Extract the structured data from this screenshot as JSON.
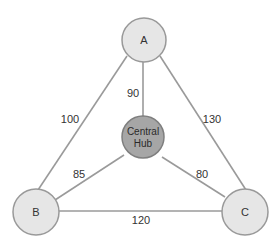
{
  "diagram": {
    "type": "network-graph",
    "nodes": [
      {
        "id": "A",
        "label": "A"
      },
      {
        "id": "B",
        "label": "B"
      },
      {
        "id": "C",
        "label": "C"
      },
      {
        "id": "hub",
        "label_line1": "Central",
        "label_line2": "Hub"
      }
    ],
    "edges": [
      {
        "from": "A",
        "to": "B",
        "weight": "100"
      },
      {
        "from": "A",
        "to": "C",
        "weight": "130"
      },
      {
        "from": "B",
        "to": "C",
        "weight": "120"
      },
      {
        "from": "A",
        "to": "hub",
        "weight": "90"
      },
      {
        "from": "B",
        "to": "hub",
        "weight": "85"
      },
      {
        "from": "C",
        "to": "hub",
        "weight": "80"
      }
    ],
    "colors": {
      "node_fill": "#e6e6e6",
      "hub_fill": "#a6a6a6",
      "edge": "#9a9a9a"
    }
  }
}
